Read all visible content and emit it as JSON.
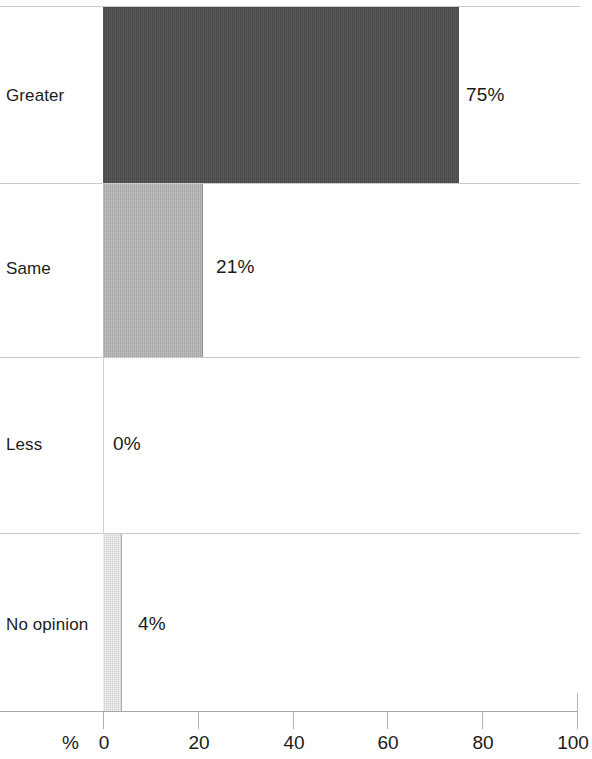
{
  "chart_data": {
    "type": "bar",
    "orientation": "horizontal",
    "title": "",
    "subtitle": "",
    "xlabel": "%",
    "ylabel": "",
    "categories": [
      "Greater",
      "Same",
      "Less",
      "No opinion"
    ],
    "values": [
      75,
      21,
      0,
      4
    ],
    "value_labels": [
      "75%",
      "21%",
      "0%",
      "4%"
    ],
    "xlim": [
      0,
      100
    ],
    "xticks": [
      0,
      20,
      40,
      60,
      80,
      100
    ],
    "xtick_labels": [
      "0",
      "20",
      "40",
      "60",
      "80",
      "100"
    ],
    "grid": true,
    "grid_axis": "y",
    "legend": false,
    "legend_position": "none",
    "series": [
      {
        "name": "Response share",
        "values": [
          75,
          21,
          0,
          4
        ]
      }
    ],
    "bar_colors": [
      "#4d4d4d",
      "#b5b5b5",
      "#ffffff",
      "#e3e3e3"
    ],
    "colors": {
      "bar_greater": "#4d4d4d",
      "bar_same": "#b5b5b5",
      "bar_less": "#ffffff",
      "bar_no_opinion": "#e3e3e3",
      "gridline": "#c9c9c9",
      "axis": "#a8a8a8",
      "text": "#1a1a1a",
      "background": "#ffffff"
    }
  },
  "axis": {
    "unit_label": "%",
    "ticks": [
      {
        "label": "0",
        "value": 0
      },
      {
        "label": "20",
        "value": 20
      },
      {
        "label": "40",
        "value": 40
      },
      {
        "label": "60",
        "value": 60
      },
      {
        "label": "80",
        "value": 80
      },
      {
        "label": "100",
        "value": 100
      }
    ]
  },
  "bands": [
    {
      "category": "Greater",
      "value_label": "75%"
    },
    {
      "category": "Same",
      "value_label": "21%"
    },
    {
      "category": "Less",
      "value_label": "0%"
    },
    {
      "category": "No opinion",
      "value_label": "4%"
    }
  ]
}
